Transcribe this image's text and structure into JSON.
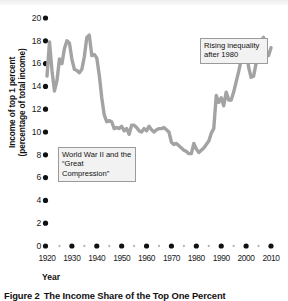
{
  "figure": {
    "caption_number": "Figure 2",
    "caption_title": "The Income Share of the Top One Percent"
  },
  "axes": {
    "xlabel": "Year",
    "ylabel_line1": "Income of top 1 percent",
    "ylabel_line2": "(percentage of total income)"
  },
  "annotations": [
    {
      "id": "ww2",
      "text": "World War II and the “Great Compression”"
    },
    {
      "id": "rising",
      "text": "Rising inequality after 1980"
    }
  ],
  "chart_data": {
    "type": "line",
    "title": "The Income Share of the Top One Percent",
    "xlabel": "Year",
    "ylabel": "Income of top 1 percent (percentage of total income)",
    "xlim": [
      1920,
      2012
    ],
    "ylim": [
      0,
      20
    ],
    "xticks": [
      1920,
      1930,
      1940,
      1950,
      1960,
      1970,
      1980,
      1990,
      2000,
      2010
    ],
    "minor_xticks": [
      1925,
      1935,
      1945,
      1955,
      1965,
      1975,
      1985,
      1995,
      2005
    ],
    "yticks": [
      0,
      2,
      4,
      6,
      8,
      10,
      12,
      14,
      16,
      18,
      20
    ],
    "grid": false,
    "legend": "none",
    "line_color": "#a3a3a3",
    "line_width": 3.4,
    "annotations": [
      {
        "text": "World War II and the “Great Compression”",
        "x": 1938,
        "y": 7.2
      },
      {
        "text": "Rising inequality after 1980",
        "x": 1996,
        "y": 17.8
      }
    ],
    "x": [
      1920,
      1921,
      1922,
      1923,
      1924,
      1925,
      1926,
      1927,
      1928,
      1929,
      1930,
      1931,
      1932,
      1933,
      1934,
      1935,
      1936,
      1937,
      1938,
      1939,
      1940,
      1941,
      1942,
      1943,
      1944,
      1945,
      1946,
      1947,
      1948,
      1949,
      1950,
      1951,
      1952,
      1953,
      1954,
      1955,
      1956,
      1957,
      1958,
      1959,
      1960,
      1961,
      1962,
      1963,
      1964,
      1965,
      1966,
      1967,
      1968,
      1969,
      1970,
      1971,
      1972,
      1973,
      1974,
      1975,
      1976,
      1977,
      1978,
      1979,
      1980,
      1981,
      1982,
      1983,
      1984,
      1985,
      1986,
      1987,
      1988,
      1989,
      1990,
      1991,
      1992,
      1993,
      1994,
      1995,
      1996,
      1997,
      1998,
      1999,
      2000,
      2001,
      2002,
      2003,
      2004,
      2005,
      2006,
      2007,
      2008,
      2009,
      2010
    ],
    "values": [
      14.9,
      17.9,
      15.4,
      13.6,
      14.5,
      16.4,
      16.0,
      17.3,
      18.0,
      17.8,
      16.4,
      15.5,
      15.4,
      15.2,
      15.5,
      16.6,
      18.3,
      18.5,
      16.7,
      16.8,
      16.5,
      15.0,
      13.0,
      11.5,
      10.9,
      11.0,
      10.9,
      10.3,
      10.4,
      10.3,
      10.5,
      10.1,
      10.3,
      9.8,
      10.6,
      10.6,
      10.4,
      10.1,
      10.0,
      10.3,
      10.1,
      10.5,
      10.2,
      10.0,
      10.2,
      10.3,
      10.3,
      10.4,
      10.2,
      10.0,
      9.1,
      8.9,
      9.0,
      8.8,
      8.6,
      8.4,
      8.3,
      8.1,
      8.1,
      9.0,
      8.5,
      8.2,
      8.4,
      8.6,
      8.9,
      9.2,
      9.9,
      10.3,
      13.2,
      12.6,
      13.0,
      12.3,
      13.5,
      12.8,
      12.8,
      13.5,
      14.4,
      15.3,
      16.3,
      17.2,
      17.6,
      15.7,
      14.8,
      14.9,
      16.0,
      17.4,
      18.0,
      18.3,
      17.1,
      16.7,
      17.4
    ]
  }
}
